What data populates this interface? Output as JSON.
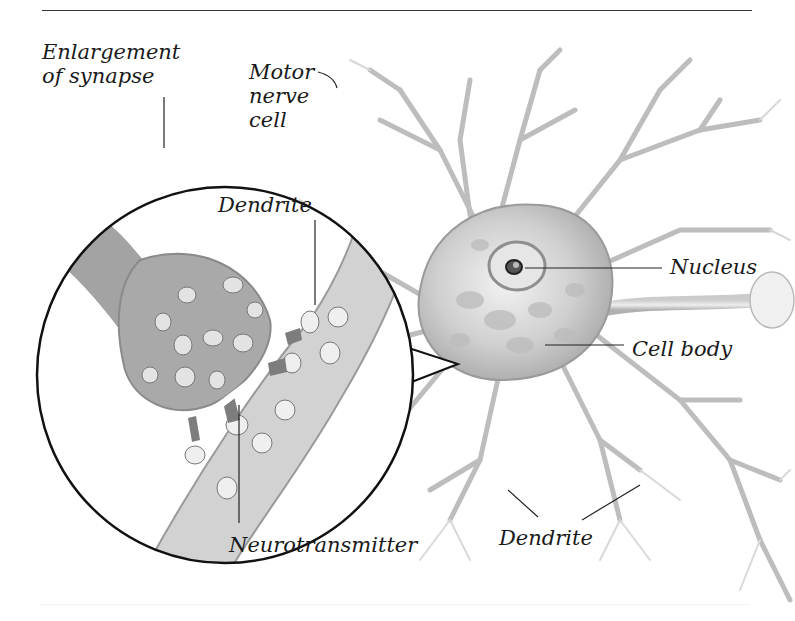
{
  "diagram": {
    "labels": {
      "enlargement_line1": "Enlargement",
      "enlargement_line2": "of synapse",
      "motor_line1": "Motor",
      "motor_line2": "nerve",
      "motor_line3": "cell",
      "dendrite_inset": "Dendrite",
      "nucleus": "Nucleus",
      "cell_body": "Cell body",
      "neurotransmitter": "Neurotransmitter",
      "dendrite_bottom": "Dendrite"
    },
    "colors": {
      "background": "#ffffff",
      "ink": "#1a1a1a",
      "tissue_light": "#d9d9d9",
      "tissue_mid": "#b5b5b5",
      "tissue_dark": "#8c8c8c",
      "leader_line": "#222222"
    }
  }
}
